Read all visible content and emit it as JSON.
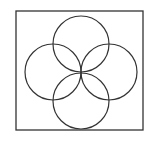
{
  "diagram": {
    "stroke_color": "#333333",
    "background": "#ffffff",
    "frame": {
      "x": 16,
      "y": 11,
      "width": 127,
      "height": 119
    },
    "center": {
      "x": 81,
      "y": 72
    },
    "circles": [
      {
        "name": "top",
        "cx": 81,
        "cy": 44,
        "r": 28
      },
      {
        "name": "left",
        "cx": 53,
        "cy": 72,
        "r": 28
      },
      {
        "name": "right",
        "cx": 109,
        "cy": 72,
        "r": 28
      },
      {
        "name": "bottom",
        "cx": 81,
        "cy": 101,
        "r": 28
      }
    ]
  }
}
